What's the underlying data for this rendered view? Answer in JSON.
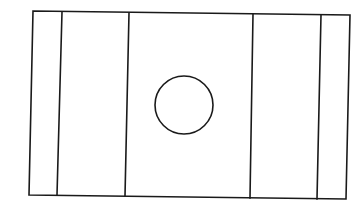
{
  "diagram": {
    "type": "line-drawing",
    "stroke_color": "#1a1a1a",
    "background_color": "#ffffff",
    "outer_rect": {
      "corners": {
        "top_left": [
          33,
          11
        ],
        "top_right": [
          350,
          15
        ],
        "bottom_right": [
          346,
          199
        ],
        "bottom_left": [
          29,
          195
        ]
      }
    },
    "vertical_lines": [
      {
        "id": "divider-1",
        "top": [
          62,
          12
        ],
        "bottom": [
          57,
          195
        ]
      },
      {
        "id": "divider-2",
        "top": [
          129,
          13
        ],
        "bottom": [
          125,
          196
        ]
      },
      {
        "id": "divider-3",
        "top": [
          253,
          14
        ],
        "bottom": [
          250,
          198
        ]
      },
      {
        "id": "divider-4",
        "top": [
          321,
          15
        ],
        "bottom": [
          317,
          199
        ]
      }
    ],
    "circle": {
      "cx": 184,
      "cy": 105,
      "r": 29
    },
    "panels": 5
  }
}
